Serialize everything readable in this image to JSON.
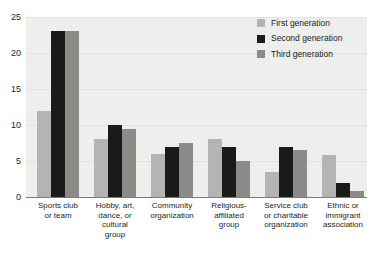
{
  "chart_data": {
    "type": "bar",
    "title": "",
    "subtitle": "",
    "xlabel": "",
    "ylabel": "",
    "ylim": [
      0,
      25
    ],
    "yticks": [
      0,
      5,
      10,
      15,
      20,
      25
    ],
    "grid": true,
    "legend_position": "top-right",
    "categories": [
      "Sports club or team",
      "Hobby, art, dance, or cultural group",
      "Community organization",
      "Religious-affiliated group",
      "Service club or charitable organization",
      "Ethnic or immigrant association"
    ],
    "category_label_lines": [
      [
        "Sports club",
        "or team"
      ],
      [
        "Hobby, art,",
        "dance, or",
        "cultural",
        "group"
      ],
      [
        "Community",
        "organization"
      ],
      [
        "Religious-",
        "affiliated",
        "group"
      ],
      [
        "Service club",
        "or charitable",
        "organization"
      ],
      [
        "Ethnic or",
        "immigrant",
        "association"
      ]
    ],
    "series": [
      {
        "name": "First generation",
        "color": "#b4b4b2",
        "values": [
          12,
          8,
          6,
          8,
          3.5,
          5.8
        ]
      },
      {
        "name": "Second generation",
        "color": "#1c1a18",
        "values": [
          23,
          10,
          7,
          7,
          7,
          2
        ]
      },
      {
        "name": "Third generation",
        "color": "#8b8b88",
        "values": [
          23,
          9.5,
          7.5,
          5,
          6.5,
          0.8
        ]
      }
    ]
  },
  "legend": {
    "items": [
      {
        "label": "First generation",
        "color": "#b4b4b2"
      },
      {
        "label": "Second generation",
        "color": "#1c1a18"
      },
      {
        "label": "Third generation",
        "color": "#8b8b88"
      }
    ]
  },
  "axes": {
    "y_tick_labels": [
      "25",
      "20",
      "15",
      "10",
      "5",
      "0"
    ]
  },
  "colors": {
    "plot_background": "#eeeeec",
    "gridline": "#e2e2df",
    "axis": "#7a7a78",
    "text": "#231f20"
  }
}
